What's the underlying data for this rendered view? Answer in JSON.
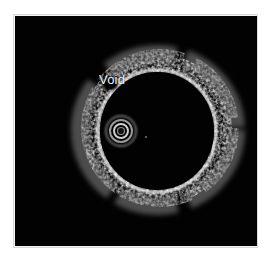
{
  "figure": {
    "type": "intravascular cross-sectional image",
    "annotations": [
      {
        "text": "Void"
      }
    ]
  }
}
